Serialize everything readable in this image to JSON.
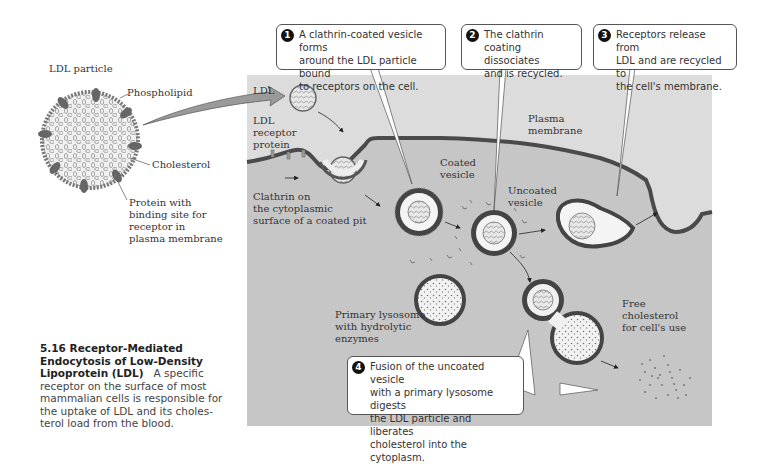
{
  "figure": {
    "number": "5.16",
    "title": "Receptor-Mediated Endocytosis of Low-Density Lipoprotein (LDL)",
    "title_line1": "5.16  Receptor-Mediated",
    "title_line2": "Endocytosis of Low-Density",
    "title_line3": "Lipoprotein (LDL)",
    "body_line3": "A specific",
    "body_line4": "receptor on the surface of most",
    "body_line5": "mammalian cells is responsible for",
    "body_line6": "the uptake of LDL and its choles-",
    "body_line7": "terol load from the blood."
  },
  "ldl_particle": {
    "title": "LDL particle",
    "labels": {
      "phospholipid": "Phospholipid",
      "cholesterol": "Cholesterol",
      "protein_l1": "Protein with",
      "protein_l2": "binding site for",
      "protein_l3": "receptor in",
      "protein_l4": "plasma membrane"
    }
  },
  "panel_labels": {
    "ldl": "LDL",
    "receptor_l1": "LDL",
    "receptor_l2": "receptor",
    "receptor_l3": "protein",
    "clathrin_l1": "Clathrin on",
    "clathrin_l2": "the cytoplasmic",
    "clathrin_l3": "surface of a coated pit",
    "coated_l1": "Coated",
    "coated_l2": "vesicle",
    "uncoated_l1": "Uncoated",
    "uncoated_l2": "vesicle",
    "plasma_l1": "Plasma",
    "plasma_l2": "membrane",
    "lysosome_l1": "Primary lysosome",
    "lysosome_l2": "with hydrolytic",
    "lysosome_l3": "enzymes",
    "free_l1": "Free",
    "free_l2": "cholesterol",
    "free_l3": "for cell's use"
  },
  "steps": [
    {
      "number": "1",
      "text_l1": "A clathrin-coated vesicle forms",
      "text_l2": "around the LDL particle bound",
      "text_l3": "to receptors on the cell."
    },
    {
      "number": "2",
      "text_l1": "The clathrin",
      "text_l2": "coating dissociates",
      "text_l3": "and is recycled."
    },
    {
      "number": "3",
      "text_l1": "Receptors release from",
      "text_l2": "LDL and are recycled to",
      "text_l3": "the cell's membrane."
    },
    {
      "number": "4",
      "text_l1": "Fusion of the uncoated vesicle",
      "text_l2": "with a primary lysosome digests",
      "text_l3": "the LDL particle and liberates",
      "text_l4": "cholesterol into the cytoplasm."
    }
  ],
  "colors": {
    "extracellular": "#dcdcdc",
    "cytoplasm": "#c6c6c6",
    "membrane": "#4a4a4a",
    "arrow_fill": "#9a9a9a"
  }
}
